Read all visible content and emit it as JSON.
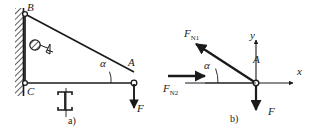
{
  "figure": {
    "type": "engineering-statics-diagram",
    "stroke_color": "#1a1a1a",
    "background_color": "#ffffff",
    "panels": [
      {
        "id": "a",
        "caption": "a)",
        "labels": {
          "point_B": "B",
          "point_C": "C",
          "point_A": "A",
          "angle": "α",
          "force": "F"
        },
        "elements": [
          "hatched-wall",
          "pin-support-B",
          "pin-support-C",
          "inclined-member-BA",
          "horizontal-member-CA",
          "roller-symbol",
          "i-beam-section-symbol",
          "load-arrow-F"
        ]
      },
      {
        "id": "b",
        "caption": "b)",
        "labels": {
          "force_n1": "F",
          "force_n1_sub": "N1",
          "force_n2": "F",
          "force_n2_sub": "N2",
          "axis_x": "x",
          "axis_y": "y",
          "point_A": "A",
          "angle": "α",
          "force": "F"
        },
        "elements": [
          "axis-x-arrow",
          "axis-y-arrow",
          "origin-node-A",
          "force-FN1-arrow",
          "force-FN2-arrow",
          "force-F-arrow",
          "angle-arc"
        ]
      }
    ]
  }
}
